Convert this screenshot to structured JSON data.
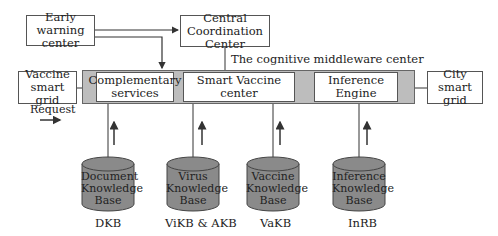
{
  "diagram": {
    "top_boxes": {
      "early_warning": "Early warning center",
      "central": "Central Coordination Center"
    },
    "middleware_label": "The cognitive middleware center",
    "left_box": "Vaccine smart grid",
    "right_box": "City smart grid",
    "request_label": "Request",
    "middleware_components": [
      {
        "label": "Complementary services"
      },
      {
        "label": "Smart Vaccine center"
      },
      {
        "label": "Inference Engine"
      }
    ],
    "knowledge_bases": [
      {
        "label": "Document Knowledge Base",
        "abbr": "DKB"
      },
      {
        "label": "Virus Knowledge Base",
        "abbr": "ViKB & AKB"
      },
      {
        "label": "Vaccine Knowledge Base",
        "abbr": "VaKB"
      },
      {
        "label": "Inference Knowledge Base",
        "abbr": "InRB"
      }
    ],
    "colors": {
      "band": "#bdbdbd",
      "cylinder": "#8a8a8a",
      "line": "#333333"
    }
  }
}
